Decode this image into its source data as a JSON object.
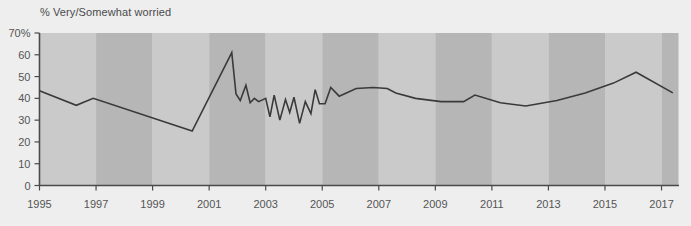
{
  "chart_data": {
    "type": "line",
    "title": "",
    "ylabel": "% Very/Somewhat worried",
    "xlabel": "",
    "ylim": [
      0,
      70
    ],
    "xlim": [
      1995,
      2017.6
    ],
    "grid": false,
    "legend": null,
    "y_ticks": [
      "0",
      "10",
      "20",
      "30",
      "40",
      "50",
      "60",
      "70%"
    ],
    "y_tick_values": [
      0,
      10,
      20,
      30,
      40,
      50,
      60,
      70
    ],
    "x_ticks": [
      "1995",
      "1997",
      "1999",
      "2001",
      "2003",
      "2005",
      "2007",
      "2009",
      "2011",
      "2013",
      "2015",
      "2017"
    ],
    "x_tick_values": [
      1995,
      1997,
      1999,
      2001,
      2003,
      2005,
      2007,
      2009,
      2011,
      2013,
      2015,
      2017
    ],
    "band_shading": {
      "light_color": "#cacaca",
      "dark_color": "#b6b6b6",
      "period_years": 2,
      "start_year": 1995
    },
    "line_color": "#3a3a3a",
    "line_width": 1.6,
    "series": [
      {
        "name": "% Very/Somewhat worried",
        "x": [
          1995.0,
          1996.3,
          1996.9,
          2000.4,
          2001.8,
          2001.95,
          2002.1,
          2002.3,
          2002.45,
          2002.6,
          2002.75,
          2003.0,
          2003.15,
          2003.3,
          2003.5,
          2003.7,
          2003.85,
          2004.0,
          2004.2,
          2004.4,
          2004.6,
          2004.75,
          2004.9,
          2005.1,
          2005.3,
          2005.6,
          2006.2,
          2006.8,
          2007.3,
          2007.6,
          2008.3,
          2009.2,
          2010.0,
          2010.4,
          2011.3,
          2012.2,
          2013.3,
          2014.3,
          2015.3,
          2016.1,
          2017.4
        ],
        "y": [
          43.5,
          36.8,
          40.0,
          25.0,
          61.0,
          42.0,
          39.0,
          46.0,
          38.0,
          40.0,
          38.5,
          40.0,
          31.5,
          41.5,
          30.0,
          39.5,
          33.5,
          40.5,
          28.5,
          38.5,
          33.0,
          44.0,
          37.5,
          37.5,
          45.0,
          41.0,
          44.5,
          45.0,
          44.5,
          42.5,
          40.0,
          38.5,
          38.5,
          41.5,
          38.0,
          36.5,
          39.0,
          42.5,
          47.0,
          52.0,
          42.5
        ]
      }
    ]
  },
  "axis": {
    "y_title": "% Very/Somewhat worried"
  }
}
